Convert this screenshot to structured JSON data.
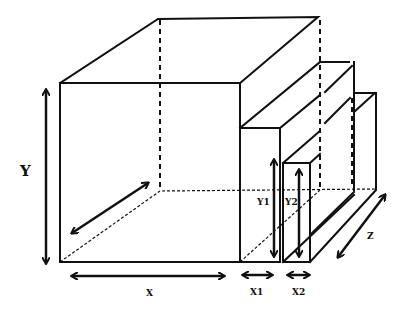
{
  "diagram": {
    "labels": {
      "y": "Y",
      "x": "X",
      "x1": "X1",
      "x2": "X2",
      "y1": "Y1",
      "y2": "Y2",
      "z": "Z"
    },
    "components": [
      {
        "name": "main-box",
        "width_label": "X",
        "height_label": "Y",
        "depth_label": "Z"
      },
      {
        "name": "slab-1",
        "width_label": "X1",
        "height_label": "Y1"
      },
      {
        "name": "slab-2",
        "width_label": "X2",
        "height_label": "Y2"
      }
    ],
    "colors": {
      "line": "#111111",
      "background": "#ffffff"
    }
  }
}
